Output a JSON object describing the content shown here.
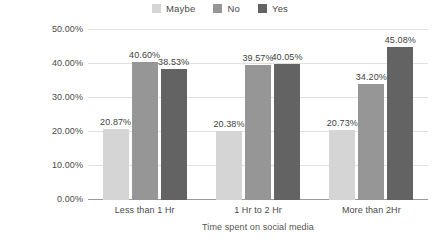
{
  "chart_data": {
    "type": "bar",
    "title": "",
    "xlabel": "Time spent on social media",
    "ylabel": "Social media influence",
    "categories": [
      "Less than 1 Hr",
      "1 Hr to 2 Hr",
      "More than 2Hr"
    ],
    "series": [
      {
        "name": "Maybe",
        "color": "#d5d5d5",
        "values": [
          20.87,
          20.38,
          20.73
        ],
        "labels": [
          "20.87%",
          "20.38%",
          "20.73%"
        ]
      },
      {
        "name": "No",
        "color": "#969696",
        "values": [
          40.6,
          39.57,
          34.2
        ],
        "labels": [
          "40.60%",
          "39.57%",
          "34.20%"
        ]
      },
      {
        "name": "Yes",
        "color": "#636363",
        "values": [
          38.53,
          40.05,
          45.08
        ],
        "labels": [
          "38.53%",
          "40.05%",
          "45.08%"
        ]
      }
    ],
    "ylim": [
      0,
      50
    ],
    "yticks": [
      0,
      10,
      20,
      30,
      40,
      50
    ],
    "ytick_labels": [
      "0.00%",
      "10.00%",
      "20.00%",
      "30.00%",
      "40.00%",
      "50.00%"
    ],
    "grid": true,
    "legend_position": "top-center"
  },
  "legend": {
    "items": [
      {
        "label": "Maybe",
        "color": "#d5d5d5"
      },
      {
        "label": "No",
        "color": "#969696"
      },
      {
        "label": "Yes",
        "color": "#636363"
      }
    ]
  }
}
